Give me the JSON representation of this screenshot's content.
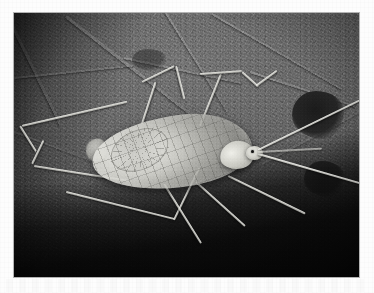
{
  "page": {
    "background_color": "#fdfdfd",
    "kind": "scanned-page-with-photograph"
  },
  "photo": {
    "title": "Winged insect resting on a leaf",
    "subject": "winged-insect",
    "medium": "black-and-white photograph",
    "frame": {
      "x": 14,
      "y": 13,
      "width": 345,
      "height": 264
    },
    "palette": {
      "leaf_light": "#7a7a7a",
      "leaf_mid": "#565656",
      "leaf_dark": "#222222",
      "shadow": "#070707",
      "insect_light": "#f2f2ec",
      "insect_mid": "#c9c9c2",
      "insect_dark": "#7e7e78"
    },
    "scene": {
      "background_label": "leaf surface with veins and dark blotches",
      "lighting": "top-left highlight fading to deep shadow at bottom",
      "focus": "insect centered, background softly textured"
    },
    "subject_parts": [
      {
        "name": "forewing",
        "label": "translucent veined forewing"
      },
      {
        "name": "wing-cell",
        "label": "radiating wing venation cell"
      },
      {
        "name": "abdomen-tip",
        "label": "abdomen tip"
      },
      {
        "name": "thorax",
        "label": "thorax"
      },
      {
        "name": "head",
        "label": "head"
      },
      {
        "name": "eye",
        "label": "compound eye"
      },
      {
        "name": "antenna",
        "label": "long slender antenna"
      },
      {
        "name": "leg",
        "label": "long slender leg"
      }
    ],
    "leaf_features": [
      {
        "name": "vein",
        "label": "leaf vein"
      },
      {
        "name": "blotch",
        "label": "dark blotch in leaf"
      }
    ]
  }
}
